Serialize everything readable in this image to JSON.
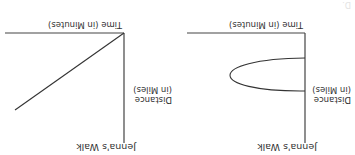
{
  "figure": {
    "orientation": "rotated 180 degrees",
    "graphs": [
      {
        "id": "A",
        "title": "Jenna's Walk",
        "y_label_line1": "Distance",
        "y_label_line2": "(in Miles)",
        "x_label": "Time (in Minutes)",
        "curve": "straight line increasing from origin"
      },
      {
        "id": "B",
        "title": "Jenna's Walk",
        "y_label_line1": "Distance",
        "y_label_line2": "(in Miles)",
        "x_label": "Time (in Minutes)",
        "curve": "sideways U-shaped loop opening toward the y-axis"
      }
    ],
    "partial_text": "D."
  },
  "colors": {
    "axis": "#444444",
    "curve": "#333333",
    "text": "#333333"
  }
}
